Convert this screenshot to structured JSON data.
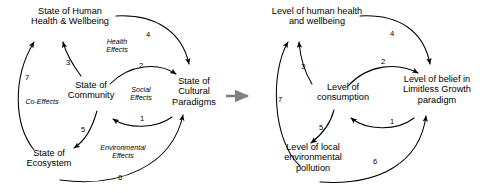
{
  "figure": {
    "type": "causal-loop-diagram-pair",
    "transition_arrow": "right-arrow-icon",
    "stroke_color": "#000000",
    "transition_arrow_color": "#808080"
  },
  "left_diagram": {
    "name": "generic-systems-model",
    "nodes": [
      {
        "id": "human-health",
        "label": "State of Human\nHealth & Wellbeing"
      },
      {
        "id": "community",
        "label": "State of\nCommunity"
      },
      {
        "id": "cultural-paradigms",
        "label": "State of\nCultural\nParadigms"
      },
      {
        "id": "ecosystem",
        "label": "State of\nEcosystem"
      }
    ],
    "edge_labels": [
      {
        "id": "health-effects",
        "label": "Health\nEffects"
      },
      {
        "id": "social-effects",
        "label": "Social\nEffects"
      },
      {
        "id": "environmental-effects",
        "label": "Environmental\nEffects"
      },
      {
        "id": "co-effects",
        "label": "Co-Effects"
      }
    ],
    "edge_numbers": [
      {
        "id": "edge-1",
        "label": "1",
        "from": "cultural-paradigms",
        "to": "community"
      },
      {
        "id": "edge-2",
        "label": "2",
        "from": "community",
        "to": "cultural-paradigms"
      },
      {
        "id": "edge-3",
        "label": "3",
        "from": "community",
        "to": "human-health"
      },
      {
        "id": "edge-4",
        "label": "4",
        "from": "human-health",
        "to": "cultural-paradigms"
      },
      {
        "id": "edge-5",
        "label": "5",
        "from": "community",
        "to": "ecosystem"
      },
      {
        "id": "edge-6",
        "label": "6",
        "from": "ecosystem",
        "to": "cultural-paradigms"
      },
      {
        "id": "edge-7",
        "label": "7",
        "from": "ecosystem",
        "to": "human-health"
      }
    ]
  },
  "right_diagram": {
    "name": "limitless-growth-instance-model",
    "nodes": [
      {
        "id": "human-health",
        "label": "Level of human health\nand wellbeing"
      },
      {
        "id": "consumption",
        "label": "Level of\nconsumption"
      },
      {
        "id": "belief",
        "label": "Level of belief in\nLimitless Growth\nparadigm"
      },
      {
        "id": "pollution",
        "label": "Level of local\nenvironmental\npollution"
      }
    ],
    "edge_labels": [],
    "edge_numbers": [
      {
        "id": "edge-1",
        "label": "1",
        "from": "belief",
        "to": "consumption"
      },
      {
        "id": "edge-2",
        "label": "2",
        "from": "consumption",
        "to": "belief"
      },
      {
        "id": "edge-3",
        "label": "3",
        "from": "consumption",
        "to": "human-health"
      },
      {
        "id": "edge-4",
        "label": "4",
        "from": "human-health",
        "to": "belief"
      },
      {
        "id": "edge-5",
        "label": "5",
        "from": "consumption",
        "to": "pollution"
      },
      {
        "id": "edge-6",
        "label": "6",
        "from": "pollution",
        "to": "belief"
      },
      {
        "id": "edge-7",
        "label": "7",
        "from": "pollution",
        "to": "human-health"
      }
    ]
  }
}
